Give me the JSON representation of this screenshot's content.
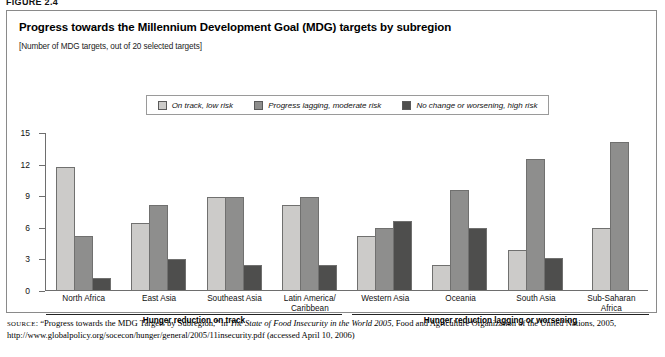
{
  "figure_label": "FIGURE 2.4",
  "panel": {
    "title": "Progress towards the Millennium Development Goal (MDG) targets by subregion",
    "subtitle": "[Number of  MDG targets, out of 20 selected targets]"
  },
  "legend": {
    "items": [
      {
        "label": "On track, low risk",
        "color": "#cccbc9"
      },
      {
        "label": "Progress lagging, moderate risk",
        "color": "#8e8e8d"
      },
      {
        "label": "No change or worsening, high risk",
        "color": "#4e4e4d"
      }
    ]
  },
  "brackets": [
    {
      "caption": "Hunger reduction on track"
    },
    {
      "caption": "Hunger reduction lagging or worsening"
    }
  ],
  "source": {
    "prefix": "SOURCE",
    "part1": ": “Progress towards the MDG Targets by Subregion,” in ",
    "italic": "The State of Food Insecurity in the World 2005",
    "part2": ", Food and Agriculture Organization of the United Nations, 2005, http://www.globalpolicy.org/socecon/hunger/general/2005/11insecurity.pdf (accessed April 10, 2006)"
  },
  "chart_data": {
    "type": "bar",
    "title": "Progress towards the Millennium Development Goal (MDG) targets by subregion",
    "subtitle": "[Number of  MDG targets, out of 20 selected targets]",
    "xlabel": "",
    "ylabel": "Number of MDG targets, out of 20 selected targets",
    "ylim": [
      0,
      15
    ],
    "yticks": [
      0,
      3,
      6,
      9,
      12,
      15
    ],
    "grid": false,
    "legend_position": "top",
    "categories": [
      "North Africa",
      "East Asia",
      "Southeast Asia",
      "Latin America/\nCaribbean",
      "Western Asia",
      "Oceania",
      "South Asia",
      "Sub-Saharan\nAfrica"
    ],
    "series": [
      {
        "name": "On track, low risk",
        "color": "#cccbc9",
        "values": [
          11.8,
          6.5,
          8.9,
          8.2,
          5.2,
          2.5,
          3.9,
          6.0
        ]
      },
      {
        "name": "Progress lagging, moderate risk",
        "color": "#8e8e8d",
        "values": [
          5.2,
          8.2,
          8.9,
          8.9,
          6.0,
          9.6,
          12.5,
          14.1
        ]
      },
      {
        "name": "No change or worsening, high risk",
        "color": "#4e4e4d",
        "values": [
          1.2,
          3.0,
          2.5,
          2.5,
          6.6,
          6.0,
          3.1,
          null
        ]
      }
    ],
    "annotations": [
      {
        "text": "Hunger reduction on track",
        "covers": [
          "North Africa",
          "East Asia",
          "Southeast Asia",
          "Latin America/Caribbean"
        ]
      },
      {
        "text": "Hunger reduction lagging or worsening",
        "covers": [
          "Western Asia",
          "Oceania",
          "South Asia",
          "Sub-Saharan Africa"
        ]
      }
    ]
  }
}
